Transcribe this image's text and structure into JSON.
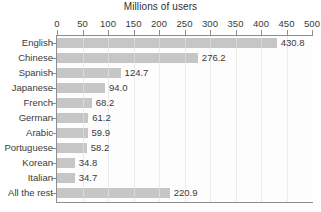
{
  "chart_data": {
    "type": "bar",
    "orientation": "horizontal",
    "title": "Millions of users",
    "xlabel": "",
    "ylabel": "",
    "xlim": [
      0,
      500
    ],
    "xticks": [
      0,
      50,
      100,
      150,
      200,
      250,
      300,
      350,
      400,
      450,
      500
    ],
    "grid": true,
    "grid_axis": "x",
    "legend": false,
    "bar_color": "#c6c6c6",
    "categories": [
      "English",
      "Chinese",
      "Spanish",
      "Japanese",
      "French",
      "German",
      "Arabic",
      "Portuguese",
      "Korean",
      "Italian",
      "All the rest"
    ],
    "values": [
      430.8,
      276.2,
      124.7,
      94.0,
      68.2,
      61.2,
      59.9,
      58.2,
      34.8,
      34.7,
      220.9
    ],
    "value_labels": [
      "430.8",
      "276.2",
      "124.7",
      "94.0",
      "68.2",
      "61.2",
      "59.9",
      "58.2",
      "34.8",
      "34.7",
      "220.9"
    ]
  }
}
